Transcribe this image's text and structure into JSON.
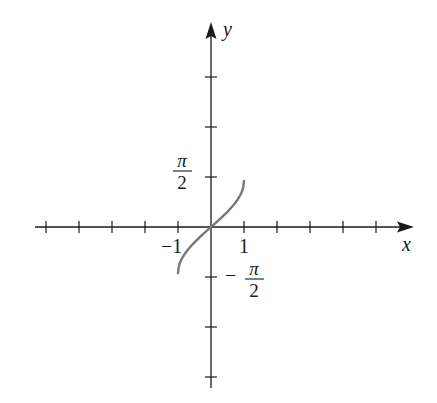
{
  "chart_data": {
    "type": "line",
    "title": "",
    "function": "y = arcsin(x)",
    "xlabel": "x",
    "ylabel": "y",
    "x_tick_labels": [
      {
        "value": -1,
        "label": "−1"
      },
      {
        "value": 1,
        "label": "1"
      }
    ],
    "y_tick_labels": [
      {
        "value": 1.5708,
        "label_num": "π",
        "label_den": "2",
        "sign": ""
      },
      {
        "value": -1.5708,
        "label_num": "π",
        "label_den": "2",
        "sign": "−"
      }
    ],
    "x_ticks_count_left": 5,
    "x_ticks_count_right": 5,
    "y_ticks_count_up": 3,
    "y_ticks_count_down": 3,
    "grid": false,
    "legend": null,
    "series": [
      {
        "name": "arcsin",
        "color": "#777777",
        "x": [
          -1,
          -0.95,
          -0.9,
          -0.8,
          -0.6,
          -0.4,
          -0.2,
          0,
          0.2,
          0.4,
          0.6,
          0.8,
          0.9,
          0.95,
          1
        ],
        "y": [
          -1.5708,
          -1.2532,
          -1.1198,
          -0.9273,
          -0.6435,
          -0.4115,
          -0.2014,
          0,
          0.2014,
          0.4115,
          0.6435,
          0.9273,
          1.1198,
          1.2532,
          1.5708
        ]
      }
    ],
    "xlim": [
      -5.3,
      6.1
    ],
    "ylim": [
      -4.3,
      4.1
    ]
  },
  "labels": {
    "x_axis": "x",
    "y_axis": "y",
    "x_neg_one": "−1",
    "x_one": "1",
    "pi": "π",
    "two": "2",
    "minus": "−"
  }
}
